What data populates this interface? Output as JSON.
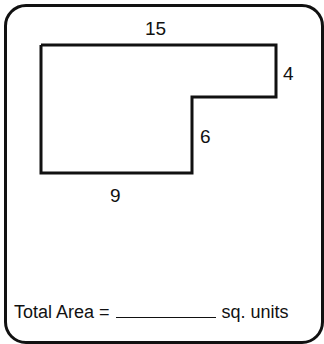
{
  "worksheet": {
    "shape": {
      "type": "L-shaped composite rectangle",
      "points": [
        [
          41,
          45
        ],
        [
          276,
          45
        ],
        [
          276,
          97
        ],
        [
          192,
          97
        ],
        [
          192,
          173
        ],
        [
          41,
          173
        ]
      ],
      "stroke_color": "#111111"
    },
    "labels": {
      "top": "15",
      "right_upper": "4",
      "right_inner": "6",
      "bottom": "9"
    },
    "answer": {
      "prefix": "Total Area =",
      "blank": "",
      "suffix": "sq. units"
    }
  }
}
